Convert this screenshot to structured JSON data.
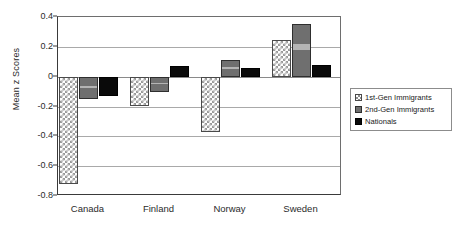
{
  "chart_data": {
    "type": "bar",
    "title": "",
    "xlabel": "",
    "ylabel": "Mean z Scores",
    "categories": [
      "Canada",
      "Finland",
      "Norway",
      "Sweden"
    ],
    "series": [
      {
        "name": "1st-Gen Immigrants",
        "values": [
          -0.72,
          -0.2,
          -0.37,
          0.245
        ],
        "fill": "cross-hatch",
        "color": "#ffffff"
      },
      {
        "name": "2nd-Gen Immigrants",
        "values": [
          -0.15,
          -0.1,
          0.11,
          0.35
        ],
        "fill": "gray",
        "color": "#6f6f6f"
      },
      {
        "name": "Nationals",
        "values": [
          -0.13,
          0.07,
          0.06,
          0.08
        ],
        "fill": "solid",
        "color": "#0a0a0a"
      }
    ],
    "ylim": [
      -0.8,
      0.4
    ],
    "ytick_values": [
      0.4,
      0.2,
      0,
      -0.2,
      -0.4,
      -0.6,
      -0.8
    ],
    "ytick_labels": [
      "0.4",
      "0.2",
      "0",
      "-0.2",
      "-0.4",
      "-0.6",
      "-0.8"
    ],
    "grid": true,
    "legend_position": "right"
  },
  "legend": {
    "entries": [
      {
        "label": "1st-Gen Immigrants"
      },
      {
        "label": "2nd-Gen Immigrants"
      },
      {
        "label": "Nationals"
      }
    ]
  }
}
